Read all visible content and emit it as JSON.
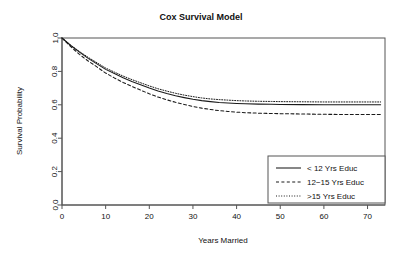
{
  "chart_data": {
    "type": "line",
    "title": "Cox Survival Model",
    "xlabel": "Years Married",
    "ylabel": "Survival Probability",
    "xlim": [
      0,
      74
    ],
    "ylim": [
      0.0,
      1.0
    ],
    "grid": false,
    "legend_position": "bottom-right",
    "xticks": [
      0,
      10,
      20,
      30,
      40,
      50,
      60,
      70
    ],
    "xtick_labels": [
      "0",
      "10",
      "20",
      "30",
      "40",
      "50",
      "60",
      "70"
    ],
    "yticks": [
      0.0,
      0.2,
      0.4,
      0.6,
      0.8,
      1.0
    ],
    "ytick_labels": [
      "0.0",
      "0.2",
      "0.4",
      "0.6",
      "0.8",
      "1.0"
    ],
    "x": [
      0,
      2,
      4,
      6,
      8,
      10,
      12,
      14,
      16,
      18,
      20,
      22,
      24,
      26,
      28,
      30,
      32,
      34,
      36,
      38,
      40,
      42,
      45,
      48,
      50,
      55,
      60,
      65,
      70,
      73
    ],
    "series": [
      {
        "name": "< 12 Yrs Educ",
        "style": "solid",
        "color": "#1a1a1a",
        "values": [
          1.0,
          0.955,
          0.915,
          0.878,
          0.845,
          0.812,
          0.787,
          0.762,
          0.74,
          0.72,
          0.7,
          0.682,
          0.667,
          0.654,
          0.643,
          0.633,
          0.625,
          0.619,
          0.614,
          0.611,
          0.608,
          0.606,
          0.604,
          0.603,
          0.602,
          0.601,
          0.6,
          0.6,
          0.6,
          0.6
        ]
      },
      {
        "name": "12−15 Yrs Educ",
        "style": "dashed",
        "color": "#1a1a1a",
        "values": [
          1.0,
          0.948,
          0.902,
          0.862,
          0.827,
          0.79,
          0.761,
          0.734,
          0.71,
          0.688,
          0.666,
          0.646,
          0.63,
          0.615,
          0.602,
          0.59,
          0.58,
          0.572,
          0.565,
          0.56,
          0.556,
          0.553,
          0.55,
          0.548,
          0.547,
          0.545,
          0.543,
          0.542,
          0.542,
          0.542
        ]
      },
      {
        "name": ">15 Yrs Educ",
        "style": "dotted",
        "color": "#1a1a1a",
        "values": [
          1.0,
          0.957,
          0.919,
          0.884,
          0.852,
          0.82,
          0.796,
          0.772,
          0.751,
          0.732,
          0.713,
          0.696,
          0.682,
          0.669,
          0.658,
          0.649,
          0.641,
          0.635,
          0.631,
          0.628,
          0.625,
          0.623,
          0.621,
          0.62,
          0.619,
          0.618,
          0.617,
          0.617,
          0.617,
          0.617
        ]
      }
    ],
    "legend": [
      {
        "label": "< 12 Yrs Educ",
        "style": "solid"
      },
      {
        "label": "12−15 Yrs Educ",
        "style": "dashed"
      },
      {
        "label": ">15 Yrs Educ",
        "style": "dotted"
      }
    ]
  }
}
